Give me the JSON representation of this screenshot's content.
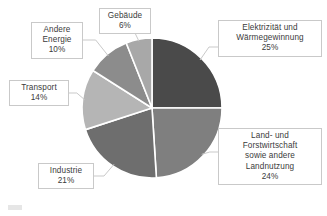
{
  "chart_data": {
    "type": "pie",
    "title": "",
    "subtitle": "",
    "xlabel": "",
    "ylabel": "",
    "legend_position": "none",
    "grid": false,
    "labels_outside": true,
    "units": "%",
    "total": 100,
    "categories": [
      "Elektrizität und Wärmegewinnung",
      "Land- und Forstwirtschaft sowie andere Landnutzung",
      "Industrie",
      "Transport",
      "Andere Energie",
      "Gebäude"
    ],
    "values": [
      25,
      24,
      21,
      14,
      10,
      6
    ],
    "colors": [
      "#4a4a4a",
      "#7f7f7f",
      "#6e6e6e",
      "#b5b5b5",
      "#8c8c8c",
      "#a8a8a8"
    ],
    "slices": [
      {
        "name": "Elektrizität und Wärmegewinnung",
        "value": 25,
        "value_label": "25%",
        "color": "#4a4a4a",
        "start_angle": 0,
        "end_angle": 90,
        "label_lines": [
          "Elektrizität und",
          "Wärmegewinnung",
          "25%"
        ]
      },
      {
        "name": "Land- und Forstwirtschaft sowie andere Landnutzung",
        "value": 24,
        "value_label": "24%",
        "color": "#7f7f7f",
        "start_angle": 90,
        "end_angle": 176.4,
        "label_lines": [
          "Land- und",
          "Forstwirtschaft",
          "sowie andere",
          "Landnutzung",
          "24%"
        ]
      },
      {
        "name": "Industrie",
        "value": 21,
        "value_label": "21%",
        "color": "#6e6e6e",
        "start_angle": 176.4,
        "end_angle": 252,
        "label_lines": [
          "Industrie",
          "21%"
        ]
      },
      {
        "name": "Transport",
        "value": 14,
        "value_label": "14%",
        "color": "#b5b5b5",
        "start_angle": 252,
        "end_angle": 302.4,
        "label_lines": [
          "Transport",
          "14%"
        ]
      },
      {
        "name": "Andere Energie",
        "value": 10,
        "value_label": "10%",
        "color": "#8c8c8c",
        "start_angle": 302.4,
        "end_angle": 338.4,
        "label_lines": [
          "Andere",
          "Energie",
          "10%"
        ]
      },
      {
        "name": "Gebäude",
        "value": 6,
        "value_label": "6%",
        "color": "#a8a8a8",
        "start_angle": 338.4,
        "end_angle": 360,
        "label_lines": [
          "Gebäude",
          "6%"
        ]
      }
    ],
    "geometry": {
      "center_x": 152,
      "center_y": 108,
      "radius": 70,
      "separator_color": "#ffffff",
      "separator_width": 1.6
    }
  },
  "callouts": {
    "elektrizitaet": {
      "line1": "Elektrizität und",
      "line2": "Wärmegewinnung",
      "line3": "25%"
    },
    "land": {
      "line1": "Land- und",
      "line2": "Forstwirtschaft",
      "line3": "sowie andere",
      "line4": "Landnutzung",
      "line5": "24%"
    },
    "industrie": {
      "line1": "Industrie",
      "line2": "21%"
    },
    "transport": {
      "line1": "Transport",
      "line2": "14%"
    },
    "andere_energie": {
      "line1": "Andere",
      "line2": "Energie",
      "line3": "10%"
    },
    "gebaeude": {
      "line1": "Gebäude",
      "line2": "6%"
    }
  }
}
